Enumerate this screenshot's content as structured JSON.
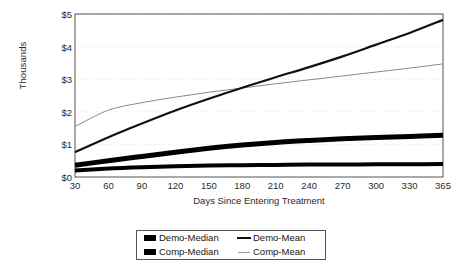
{
  "chart_data": {
    "type": "line",
    "title": "",
    "xlabel": "Days Since Entering Treatment",
    "ylabel": "Thousands",
    "x": [
      30,
      60,
      90,
      120,
      150,
      180,
      210,
      240,
      270,
      300,
      330,
      365
    ],
    "xtick_labels": [
      "30",
      "60",
      "90",
      "120",
      "150",
      "180",
      "210",
      "240",
      "270",
      "300",
      "330",
      "365"
    ],
    "ytick_labels": [
      "$0",
      "$1",
      "$2",
      "$3",
      "$4",
      "$5"
    ],
    "ytick_values": [
      0,
      1,
      2,
      3,
      4,
      5
    ],
    "ylim": [
      0,
      5
    ],
    "grid": "horizontal-dotted",
    "legend_position": "bottom-center",
    "series": [
      {
        "name": "Demo-Median",
        "style": "thick-black",
        "color": "#000000",
        "width": 5,
        "values": [
          0.36,
          0.5,
          0.63,
          0.76,
          0.88,
          0.98,
          1.06,
          1.12,
          1.17,
          1.21,
          1.24,
          1.28
        ]
      },
      {
        "name": "Demo-Mean",
        "style": "medium-black",
        "color": "#111111",
        "width": 2.2,
        "values": [
          0.76,
          1.22,
          1.64,
          2.04,
          2.4,
          2.74,
          3.06,
          3.37,
          3.7,
          4.06,
          4.42,
          4.82
        ]
      },
      {
        "name": "Comp-Median",
        "style": "thick-black",
        "color": "#000000",
        "width": 4,
        "values": [
          0.2,
          0.26,
          0.3,
          0.33,
          0.35,
          0.36,
          0.37,
          0.38,
          0.38,
          0.39,
          0.39,
          0.4
        ]
      },
      {
        "name": "Comp-Mean",
        "style": "thin-gray",
        "color": "#8a8a8a",
        "width": 1,
        "values": [
          1.55,
          2.05,
          2.28,
          2.45,
          2.6,
          2.73,
          2.86,
          2.98,
          3.1,
          3.22,
          3.34,
          3.47
        ]
      }
    ]
  },
  "axes": {
    "y_title": "Thousands",
    "x_title": "Days Since Entering Treatment"
  },
  "legend": {
    "rows": [
      {
        "left": {
          "label": "Demo-Median",
          "swatch": "thick-bar-swatch"
        },
        "right": {
          "label": "Demo-Mean",
          "swatch": "medium-line-swatch"
        }
      },
      {
        "left": {
          "label": "Comp-Median",
          "swatch": "thick-bar-swatch"
        },
        "right": {
          "label": "Comp-Mean",
          "swatch": "thin-line-swatch"
        }
      }
    ]
  }
}
